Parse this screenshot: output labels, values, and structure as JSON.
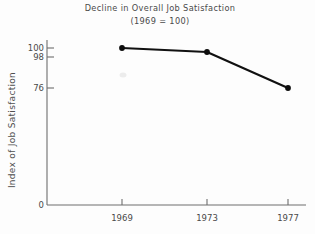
{
  "chart_data": {
    "type": "line",
    "title": "Decline in Overall Job Satisfaction",
    "subtitle": "(1969 = 100)",
    "xlabel": "",
    "ylabel": "Index of Job Satisfaction",
    "categories": [
      "1969",
      "1973",
      "1977"
    ],
    "x": [
      1969,
      1973,
      1977
    ],
    "values": [
      100,
      98,
      76
    ],
    "series": [
      {
        "name": "Index of Job Satisfaction",
        "values": [
          100,
          98,
          76
        ]
      }
    ],
    "y_tick_labels": [
      "0",
      "76",
      "98",
      "100"
    ],
    "y_tick_values": [
      0,
      76,
      98,
      100
    ],
    "x_tick_labels": [
      "1969",
      "1973",
      "1977"
    ],
    "ylim": [
      0,
      100
    ],
    "grid": false,
    "legend": false,
    "legend_position": "none",
    "marker_style": "filled-circle",
    "line_color": "#111111",
    "axis_color": "#6e6e6e",
    "note": "Vertical scale is broken/compressed between 0 and 76"
  },
  "points": [
    {
      "label": "1969",
      "value": "100",
      "cx": 122,
      "cy": 48
    },
    {
      "label": "1973",
      "value": "98",
      "cx": 207,
      "cy": 52
    },
    {
      "label": "1977",
      "value": "76",
      "cx": 288,
      "cy": 88
    }
  ],
  "geometry": {
    "polyline": "122,48 207,52 288,88",
    "y_axis": "M 47 40 L 47 205",
    "x_axis": "M 47 205 L 306 205"
  },
  "y_ticks": [
    {
      "label": "100",
      "y": 48
    },
    {
      "label": "98",
      "y": 57
    },
    {
      "label": "76",
      "y": 88
    },
    {
      "label": "0",
      "y": 205
    }
  ],
  "x_ticks": [
    {
      "label": "1969",
      "x": 122
    },
    {
      "label": "1973",
      "x": 207
    },
    {
      "label": "1977",
      "x": 288
    }
  ]
}
